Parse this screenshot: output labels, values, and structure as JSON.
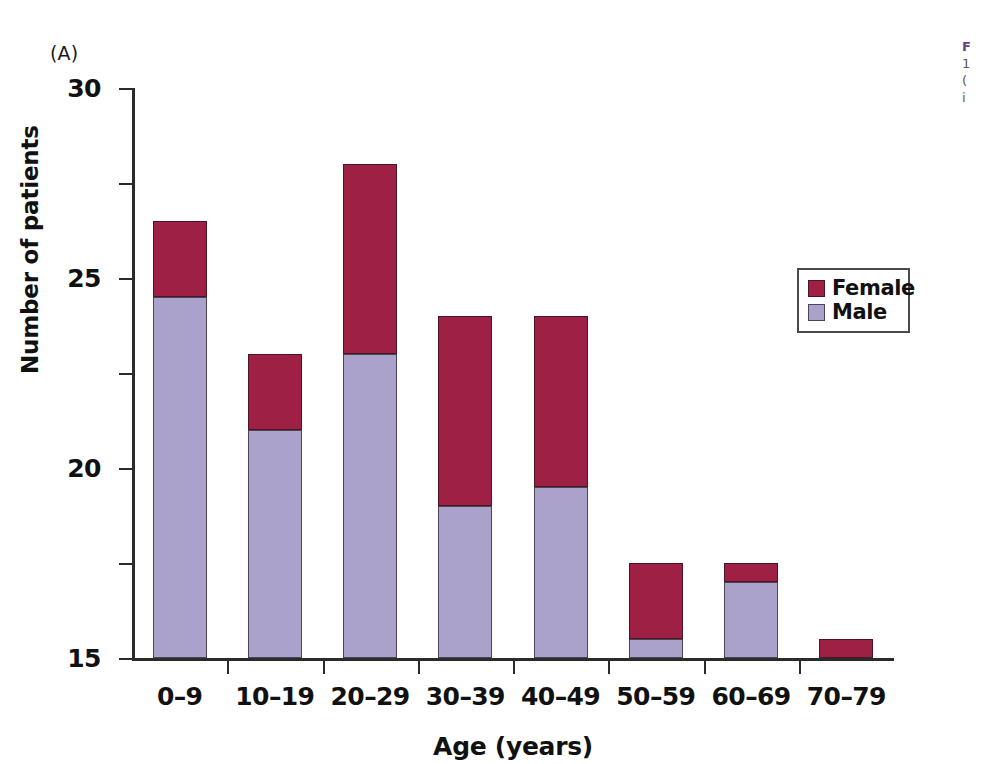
{
  "panel": {
    "letter": "(A)"
  },
  "chart_data": {
    "type": "bar",
    "subtype": "stacked-vertical",
    "title": "",
    "xlabel": "Age (years)",
    "ylabel": "Number of patients",
    "categories": [
      "0–9",
      "10–19",
      "20–29",
      "30–39",
      "40–49",
      "50–59",
      "60–69",
      "70–79"
    ],
    "series": [
      {
        "name": "Male",
        "color": "#aaa2cb",
        "values": [
          19,
          12,
          16,
          8,
          9,
          1,
          4,
          0
        ]
      },
      {
        "name": "Female",
        "color": "#9e2045",
        "values": [
          4,
          4,
          10,
          10,
          9,
          4,
          1,
          1
        ]
      }
    ],
    "totals": [
      23,
      16,
      26,
      18,
      18,
      5,
      5,
      1
    ],
    "ylim": [
      0,
      30
    ],
    "yticks": [
      0,
      5,
      10,
      15,
      20,
      25,
      30
    ],
    "ytick_labels": [
      "0",
      "5",
      "10",
      "15",
      "20",
      "25",
      "30"
    ],
    "grid": false,
    "legend_position": "right-upper",
    "stack_order": [
      "Male",
      "Female"
    ]
  },
  "legend": {
    "items": [
      {
        "label": "Female",
        "swatch": "female"
      },
      {
        "label": "Male",
        "swatch": "male"
      }
    ]
  },
  "caption": {
    "title": "F",
    "line1": "1",
    "line2": "(",
    "line3": "i"
  }
}
